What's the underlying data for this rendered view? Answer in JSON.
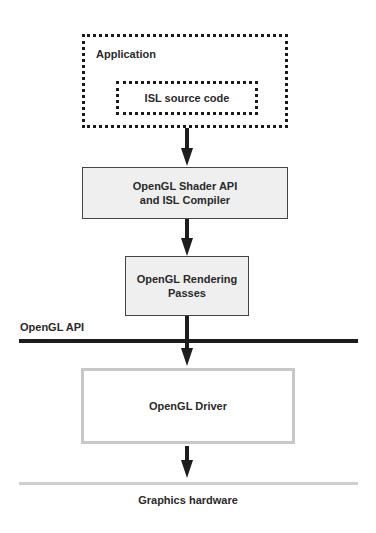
{
  "diagram": {
    "application": {
      "label": "Application"
    },
    "source_code": {
      "label": "ISL source code"
    },
    "shader_api": {
      "line1": "OpenGL Shader API",
      "line2": "and ISL Compiler"
    },
    "rendering": {
      "line1": "OpenGL Rendering",
      "line2": "Passes"
    },
    "api_boundary": {
      "label": "OpenGL API"
    },
    "driver": {
      "label": "OpenGL Driver"
    },
    "hardware": {
      "label": "Graphics hardware"
    },
    "colors": {
      "line_dark": "#1c1c1c",
      "box_fill": "#efefef",
      "driver_border": "#c8c8c8",
      "hardware_line": "#cfcfcf"
    }
  }
}
